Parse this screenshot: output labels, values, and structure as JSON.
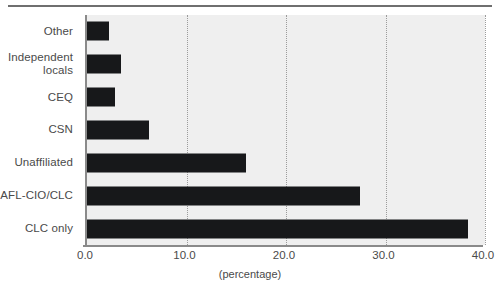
{
  "chart_data": {
    "type": "bar",
    "orientation": "horizontal",
    "title": "",
    "xlabel": "(percentage)",
    "ylabel": "",
    "categories": [
      "Other",
      "Independent locals",
      "CEQ",
      "CSN",
      "Unaffiliated",
      "AFL-CIO/CLC",
      "CLC only"
    ],
    "values": [
      2.2,
      3.4,
      2.8,
      6.2,
      16.0,
      27.4,
      38.3
    ],
    "xlim": [
      0.0,
      40.0
    ],
    "xticks": [
      0.0,
      10.0,
      20.0,
      30.0,
      40.0
    ],
    "xtick_labels": [
      "0.0",
      "10.0",
      "20.0",
      "30.0",
      "40.0"
    ],
    "grid": "vertical-dotted",
    "legend": "none",
    "bar_color": "#17181a",
    "plot_background": "#efefef"
  },
  "axis": {
    "x_label": "(percentage)",
    "ticks": [
      {
        "label": "0.0",
        "value": 0.0
      },
      {
        "label": "10.0",
        "value": 10.0
      },
      {
        "label": "20.0",
        "value": 20.0
      },
      {
        "label": "30.0",
        "value": 30.0
      },
      {
        "label": "40.0",
        "value": 40.0
      }
    ]
  },
  "categories": [
    {
      "label": "Other",
      "value": 2.2
    },
    {
      "label": "Independent locals",
      "value": 3.4
    },
    {
      "label": "CEQ",
      "value": 2.8
    },
    {
      "label": "CSN",
      "value": 6.2
    },
    {
      "label": "Unaffiliated",
      "value": 16.0
    },
    {
      "label": "AFL-CIO/CLC",
      "value": 27.4
    },
    {
      "label": "CLC only",
      "value": 38.3
    }
  ]
}
